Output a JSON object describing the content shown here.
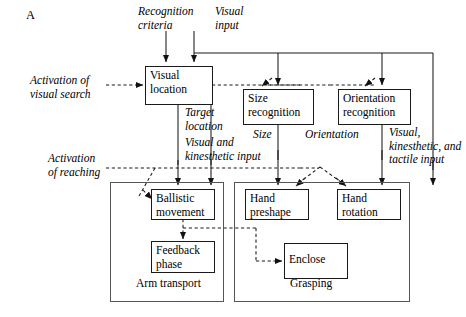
{
  "figure": {
    "panel_letter": "A",
    "width": 466,
    "height": 317,
    "background": "#ffffff",
    "line_color": "#1a1a1a",
    "group_border_color": "#555555"
  },
  "inputs": {
    "recognition_criteria": "Recognition\ncriteria",
    "visual_input": "Visual\ninput"
  },
  "activations": {
    "visual_search": "Activation of\nvisual search",
    "reaching": "Activation\nof reaching"
  },
  "nodes": {
    "visual_location": "Visual\nlocation",
    "size_recognition": "Size\nrecognition",
    "orientation_recognition": "Orientation\nrecognition",
    "ballistic_movement": "Ballistic\nmovement",
    "feedback_phase": "Feedback\nphase",
    "hand_preshape": "Hand\npreshape",
    "hand_rotation": "Hand\nrotation",
    "enclose": "Enclose"
  },
  "edge_labels": {
    "target_location": "Target\nlocation",
    "visual_kinesthetic_input": "Visual and\nkinesthetic input",
    "size": "Size",
    "orientation": "Orientation",
    "visual_kinesthetic_tactile_input": "Visual,\nkinesthetic, and\ntactile input"
  },
  "groups": {
    "arm_transport": "Arm transport",
    "grasping": "Grasping"
  }
}
